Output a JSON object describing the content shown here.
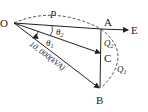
{
  "diagram": {
    "type": "power-phasor-triangle",
    "points": {
      "O": "O",
      "A": "A",
      "B": "B",
      "C": "C",
      "E": "E"
    },
    "labels": {
      "P": "P",
      "theta1": "θ",
      "theta1_sub": "1",
      "theta2": "θ",
      "theta2_sub": "2",
      "Q1": "Q",
      "Q1_sub": "1",
      "Q2": "Q",
      "Q2_sub": "2",
      "apparent_power": "10, 000(kVA)"
    },
    "colors": {
      "line": "#222222",
      "background": "#ffffff"
    }
  }
}
